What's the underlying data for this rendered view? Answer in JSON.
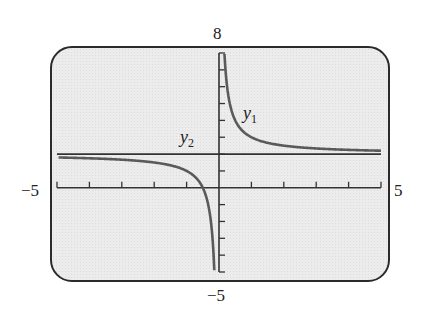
{
  "chart_data": {
    "type": "line",
    "title": "",
    "xlabel": "",
    "ylabel": "",
    "xlim": [
      -5,
      5
    ],
    "ylim": [
      -5,
      8
    ],
    "xscale_ticks": 1,
    "yscale_ticks": 1,
    "grid": false,
    "legend": "inline labels",
    "window_labels": {
      "xmin": "−5",
      "xmax": "5",
      "ymin": "−5",
      "ymax": "8"
    },
    "series": [
      {
        "name": "y1",
        "expression": "y = 2 + 1/x",
        "vertical_asymptote": 0,
        "horizontal_asymptote": 2,
        "x": [
          -5,
          -4,
          -3,
          -2,
          -1,
          -0.5,
          -0.3,
          -0.2,
          -0.15,
          0.17,
          0.2,
          0.3,
          0.5,
          1,
          2,
          3,
          4,
          5
        ],
        "y": [
          1.8,
          1.75,
          1.67,
          1.5,
          1.0,
          0.0,
          -1.33,
          -3.0,
          -4.67,
          7.88,
          7.0,
          5.33,
          4.0,
          3.0,
          2.5,
          2.33,
          2.25,
          2.2
        ],
        "color": "#5a5a5a"
      },
      {
        "name": "y2",
        "expression": "y = 2",
        "x": [
          -5,
          5
        ],
        "y": [
          2,
          2
        ],
        "color": "#333333"
      }
    ],
    "annotations": [
      {
        "text": "y1",
        "near": "right branch, x≈0.9, y≈4"
      },
      {
        "text": "y2",
        "near": "above horizontal line, x≈-1, y≈2.6"
      }
    ]
  },
  "labels": {
    "ymax": "8",
    "ymin": "−5",
    "xmin": "−5",
    "xmax": "5",
    "y1_var": "y",
    "y1_sub": "1",
    "y2_var": "y",
    "y2_sub": "2"
  },
  "colors": {
    "screen_bg": "#ececec",
    "frame": "#2a2a2a",
    "axis": "#333333",
    "curve": "#5a5a5a"
  }
}
